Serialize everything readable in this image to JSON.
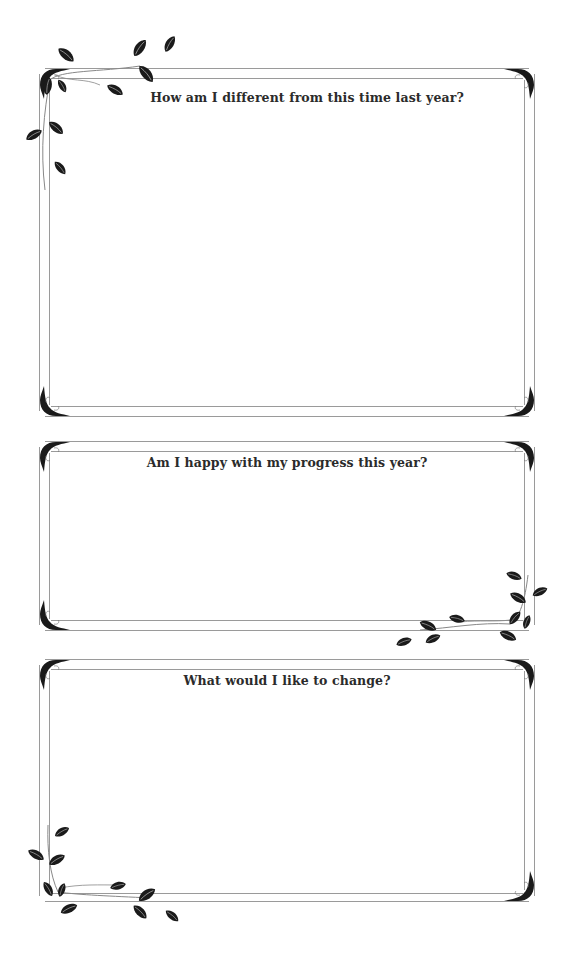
{
  "worksheet": {
    "prompts": [
      {
        "label": "How am I different from this time last year?"
      },
      {
        "label": "Am I happy with my progress this year?"
      },
      {
        "label": "What would I like to change?"
      }
    ]
  },
  "colors": {
    "frame_line": "#9a9a9a",
    "leaf": "#1a1a1a",
    "text": "#2b2b2b",
    "background": "#ffffff"
  },
  "icons": {
    "corner_flourish": "corner-flourish-icon",
    "leaf_vine": "leaf-vine-icon"
  }
}
